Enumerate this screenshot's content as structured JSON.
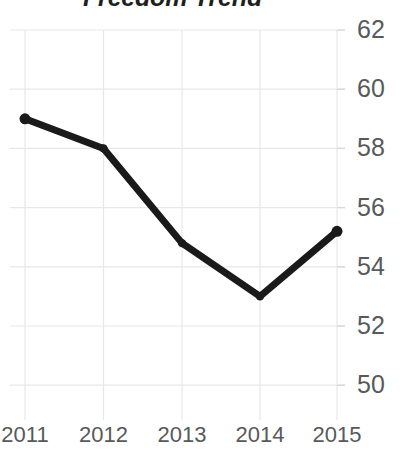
{
  "chart_data": {
    "type": "line",
    "title": "Freedom Trend",
    "xlabel": "",
    "ylabel": "",
    "categories": [
      "2011",
      "2012",
      "2013",
      "2014",
      "2015"
    ],
    "x": [
      2011,
      2012,
      2013,
      2014,
      2015
    ],
    "values": [
      59.0,
      58.0,
      54.8,
      53.0,
      55.2
    ],
    "series": [
      {
        "name": "Freedom Trend",
        "values": [
          59.0,
          58.0,
          54.8,
          53.0,
          55.2
        ]
      }
    ],
    "ylim": [
      49.0,
      62.6
    ],
    "y_ticks": [
      62,
      60,
      58,
      56,
      54,
      52,
      50
    ],
    "y_tick_labels": [
      "62",
      "60",
      "58",
      "56",
      "54",
      "52",
      "50"
    ],
    "x_tick_labels": [
      "2011",
      "2012",
      "2013",
      "2014",
      "2015"
    ],
    "grid": true,
    "grid_color": "#e8e8e8",
    "legend": false,
    "legend_position": "none",
    "line_color": "#1a1a1a",
    "line_width": 7,
    "marker": "circle",
    "marker_size": 11,
    "axis_label_color": "#58595b",
    "title_color": "#1f1f1f",
    "background": "#ffffff",
    "y_axis_side": "right",
    "annotations": []
  }
}
